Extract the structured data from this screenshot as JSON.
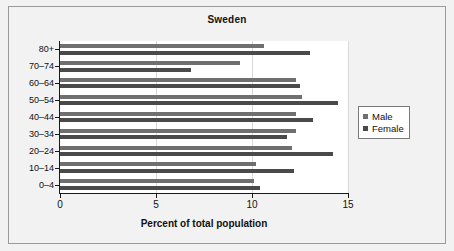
{
  "figure": {
    "background_color": "#f2f2f2",
    "plot_background_color": "#ffffff",
    "frame_color": "#9a9a9a"
  },
  "legend": {
    "position": "right",
    "entries": [
      {
        "label": "Male",
        "color": "#6f6f6f",
        "swatch": "square-swatch"
      },
      {
        "label": "Female",
        "color": "#4a4a4a",
        "swatch": "square-swatch"
      }
    ]
  },
  "chart_data": {
    "type": "bar",
    "orientation": "horizontal",
    "title": "Sweden",
    "xlabel": "Percent of total population",
    "ylabel": "",
    "xlim": [
      0,
      15
    ],
    "xticks": [
      0,
      5,
      10,
      15
    ],
    "xticklabels": [
      "0",
      "5",
      "10",
      "15"
    ],
    "grid": true,
    "grid_axis": "x",
    "categories": [
      "0–4",
      "10–14",
      "20–24",
      "30–34",
      "40–44",
      "50–54",
      "60–64",
      "70–74",
      "80+"
    ],
    "series": [
      {
        "name": "Male",
        "color": "#6f6f6f",
        "values": [
          10.1,
          10.2,
          12.1,
          12.3,
          12.3,
          12.6,
          12.3,
          9.4,
          10.6
        ]
      },
      {
        "name": "Female",
        "color": "#4a4a4a",
        "values": [
          10.4,
          12.2,
          14.2,
          11.8,
          13.2,
          14.5,
          12.5,
          6.8,
          13.0
        ]
      }
    ]
  }
}
